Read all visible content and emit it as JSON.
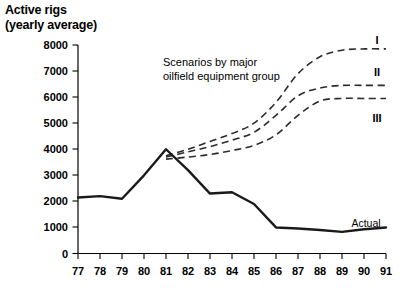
{
  "title": {
    "line1": "Active rigs",
    "line2": "(yearly average)"
  },
  "annotation": {
    "line1": "Scenarios by major",
    "line2": "oilfield equipment group"
  },
  "labels": {
    "actual": "Actual",
    "scenario_1": "I",
    "scenario_2": "II",
    "scenario_3": "III"
  },
  "chart_data": {
    "type": "line",
    "title": "Active rigs (yearly average)",
    "xlabel": "",
    "ylabel": "Active rigs",
    "ylim": [
      0,
      8000
    ],
    "grid": false,
    "legend_position": "inline-right",
    "yticks": [
      0,
      1000,
      2000,
      3000,
      4000,
      5000,
      6000,
      7000,
      8000
    ],
    "ytick_labels": [
      "0",
      "1000",
      "2000",
      "3000",
      "4000",
      "5000",
      "6000",
      "7000",
      "8000"
    ],
    "categories": [
      "77",
      "78",
      "79",
      "80",
      "81",
      "82",
      "83",
      "84",
      "85",
      "86",
      "87",
      "88",
      "89",
      "90",
      "91"
    ],
    "x": [
      77,
      78,
      79,
      80,
      81,
      82,
      83,
      84,
      85,
      86,
      87,
      88,
      89,
      90,
      91
    ],
    "series": [
      {
        "name": "Actual",
        "style": "solid",
        "x": [
          77,
          78,
          79,
          80,
          81,
          82,
          83,
          84,
          85,
          86,
          87,
          88,
          89,
          90,
          91
        ],
        "values": [
          2150,
          2200,
          2100,
          3000,
          4000,
          3200,
          2300,
          2350,
          1900,
          1000,
          960,
          900,
          830,
          930,
          1000
        ]
      },
      {
        "name": "I",
        "style": "dashed",
        "x": [
          81,
          82,
          83,
          84,
          85,
          86,
          87,
          88,
          89,
          90,
          91
        ],
        "values": [
          3750,
          4000,
          4300,
          4600,
          5000,
          5800,
          6900,
          7550,
          7800,
          7850,
          7850
        ]
      },
      {
        "name": "II",
        "style": "dashed",
        "x": [
          81,
          82,
          83,
          84,
          85,
          86,
          87,
          88,
          89,
          90,
          91
        ],
        "values": [
          3700,
          3900,
          4100,
          4350,
          4650,
          5300,
          6050,
          6350,
          6450,
          6450,
          6450
        ]
      },
      {
        "name": "III",
        "style": "dashed",
        "x": [
          81,
          82,
          83,
          84,
          85,
          86,
          87,
          88,
          89,
          90,
          91
        ],
        "values": [
          3620,
          3700,
          3800,
          3950,
          4150,
          4550,
          5300,
          5850,
          5950,
          5950,
          5950
        ]
      }
    ],
    "annotations": [
      {
        "text": "Scenarios by major oilfield equipment group",
        "x": 83,
        "y": 6700
      },
      {
        "text": "Actual",
        "x": 89.5,
        "y": 1450
      },
      {
        "text": "I",
        "x": 91,
        "y": 8000
      },
      {
        "text": "II",
        "x": 91,
        "y": 6900
      },
      {
        "text": "III",
        "x": 91,
        "y": 5500
      }
    ]
  },
  "colors": {
    "background": "#ffffff",
    "ink": "#000000",
    "actual_line": "#1a1a1a",
    "scenario_line": "#2b2b2b"
  }
}
